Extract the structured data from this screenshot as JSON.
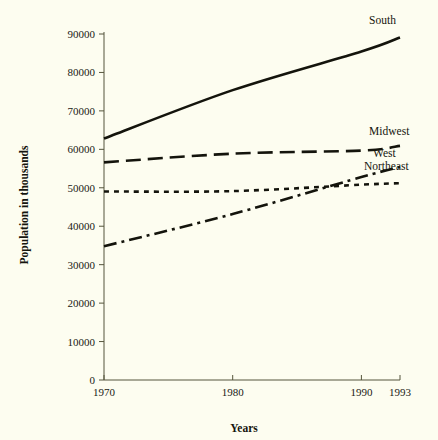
{
  "chart_data": {
    "type": "line",
    "title": "",
    "subtitle": "",
    "xlabel": "Years",
    "ylabel": "Population in thousands",
    "x": [
      1970,
      1980,
      1990,
      1993
    ],
    "xlim": [
      1970,
      1993
    ],
    "ylim": [
      0,
      90000
    ],
    "xticks": [
      "1970",
      "1980",
      "1990",
      "1993"
    ],
    "xtick_values": [
      1970,
      1980,
      1990,
      1993
    ],
    "yticks": [
      "0",
      "10000",
      "20000",
      "30000",
      "40000",
      "50000",
      "60000",
      "70000",
      "80000",
      "90000"
    ],
    "ytick_values": [
      0,
      10000,
      20000,
      30000,
      40000,
      50000,
      60000,
      70000,
      80000,
      90000
    ],
    "grid": false,
    "legend_position": "inline-right",
    "series": [
      {
        "name": "South",
        "style": "solid",
        "label_x": 1990.6,
        "label_y": 92500,
        "x": [
          1970,
          1980,
          1990,
          1993
        ],
        "values": [
          62800,
          75400,
          85450,
          89100
        ]
      },
      {
        "name": "Midwest",
        "style": "long-dash",
        "label_x": 1990.6,
        "label_y": 63700,
        "x": [
          1970,
          1980,
          1990,
          1993
        ],
        "values": [
          56600,
          58870,
          59670,
          60900
        ]
      },
      {
        "name": "West",
        "style": "dash-dot",
        "label_x": 1990.9,
        "label_y": 58000,
        "x": [
          1970,
          1980,
          1990,
          1993
        ],
        "values": [
          34800,
          43170,
          52790,
          55400
        ]
      },
      {
        "name": "Northeast",
        "style": "dotted",
        "label_x": 1990.2,
        "label_y": 54500,
        "x": [
          1970,
          1980,
          1990,
          1993
        ],
        "values": [
          49040,
          49135,
          50810,
          51200
        ]
      }
    ]
  }
}
